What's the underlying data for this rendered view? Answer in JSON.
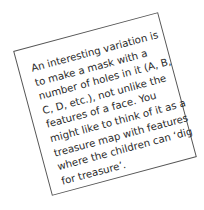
{
  "note": {
    "lines": [
      "An interesting variation is",
      "to make a mask with a",
      "number of holes in it (A, B,",
      "C, D, etc.), not unlike the",
      "features of a face. You",
      "might like to think of it as a",
      "treasure map with features",
      "where the children can ‘dig",
      "for treasure’."
    ]
  }
}
